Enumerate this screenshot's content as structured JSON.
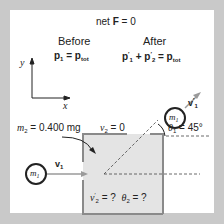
{
  "header": {
    "net_force_prefix": "net ",
    "net_force_symbol": "F",
    "net_force_value": " = 0"
  },
  "before": {
    "label": "Before",
    "eq_p1": "p",
    "eq_p1_sub": "1",
    "eq_rhs": " = p",
    "eq_rhs_sub": "tot"
  },
  "after": {
    "label": "After",
    "p1": "p",
    "p1_sub": "1",
    "plus": " + p",
    "p2_sub": "2",
    "eq": " = p",
    "tot_sub": "tot",
    "prime": "′"
  },
  "axes": {
    "x_label": "x",
    "y_label": "y"
  },
  "given": {
    "m2_symbol": "m",
    "m2_sub": "2",
    "m2_value": " = 0.400 mg",
    "v2_symbol": "v",
    "v2_sub": "2",
    "v2_value": " = 0"
  },
  "particle_incoming": {
    "label": "m",
    "sub": "1",
    "velocity": "v",
    "velocity_sub": "1"
  },
  "particle_outgoing": {
    "label": "m",
    "sub": "1",
    "velocity": "v",
    "velocity_sub": "1",
    "prime": "′"
  },
  "angle": {
    "symbol": "θ",
    "sub": "1",
    "value": " = 45°"
  },
  "unknowns": {
    "v2": "v",
    "v2_sub": "2",
    "prime": "′",
    "q1": " = ?",
    "theta": "θ",
    "theta_sub": "2",
    "q2": " = ?"
  },
  "colors": {
    "frame": "#c9c9c9",
    "target_fill": "#e4e4e4",
    "target_edge": "#8a8a8a",
    "arrow": "#9a9a9a",
    "ink": "#222222"
  }
}
